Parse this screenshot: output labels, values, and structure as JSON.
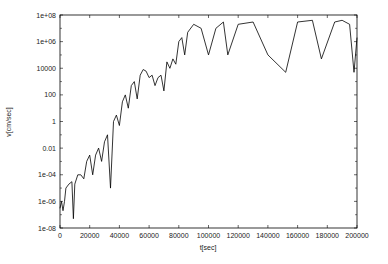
{
  "chart_data": {
    "type": "line",
    "title": "",
    "xlabel": "t[sec]",
    "ylabel": "v[cm/sec]",
    "xlim": [
      0,
      200000
    ],
    "ylim": [
      1e-08,
      100000000.0
    ],
    "yscale": "log",
    "grid": false,
    "legend": null,
    "x_ticks": [
      "0",
      "20000",
      "40000",
      "60000",
      "80000",
      "100000",
      "120000",
      "140000",
      "160000",
      "180000",
      "200000"
    ],
    "y_ticks": [
      "1e-08",
      "1e-06",
      "1e-04",
      "0.01",
      "1",
      "100",
      "10000",
      "1e+06",
      "1e+08"
    ],
    "series": [
      {
        "name": "v",
        "color": "#000000",
        "x": [
          0,
          1000,
          2000,
          3000,
          4000,
          6000,
          8000,
          9000,
          10000,
          12000,
          14000,
          16000,
          18000,
          20000,
          22000,
          24000,
          26000,
          28000,
          30000,
          32000,
          34000,
          36000,
          38000,
          40000,
          42000,
          44000,
          46000,
          48000,
          50000,
          52000,
          54000,
          56000,
          58000,
          60000,
          62000,
          64000,
          66000,
          68000,
          70000,
          72000,
          74000,
          76000,
          78000,
          80000,
          82000,
          84000,
          86000,
          90000,
          95000,
          100000,
          105000,
          110000,
          113000,
          120000,
          130000,
          140000,
          152000,
          160000,
          170000,
          176000,
          185000,
          190000,
          195000,
          198000,
          200000
        ],
        "y": [
          3e-07,
          1e-06,
          2e-07,
          1e-06,
          1e-05,
          2e-05,
          3e-05,
          5e-08,
          2e-05,
          0.0001,
          0.0001,
          5e-05,
          0.001,
          0.003,
          0.0001,
          0.003,
          0.01,
          0.001,
          0.03,
          0.1,
          1e-05,
          1,
          3,
          0.5,
          30,
          100,
          10,
          500,
          1000,
          50,
          3000,
          8000,
          6000,
          2000,
          3000,
          500,
          2000,
          3000,
          200,
          30000,
          10000,
          50000,
          20000,
          1000000.0,
          2000000.0,
          100000.0,
          5000000.0,
          20000000.0,
          10000000.0,
          100000.0,
          10000000.0,
          30000000.0,
          100000.0,
          20000000.0,
          30000000.0,
          100000.0,
          5000.0,
          30000000.0,
          40000000.0,
          50000.0,
          30000000.0,
          40000000.0,
          20000000.0,
          5000.0,
          2000000.0
        ]
      }
    ]
  }
}
